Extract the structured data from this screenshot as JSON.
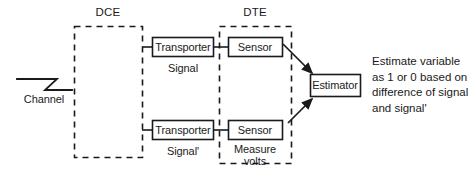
{
  "diagram": {
    "colors": {
      "stroke": "#1a1a1a",
      "background": "#ffffff",
      "text": "#1a1a1a"
    },
    "groups": [
      {
        "id": "dce",
        "label": "DCE"
      },
      {
        "id": "dte",
        "label": "DTE"
      }
    ],
    "source": {
      "label": "Channel",
      "symbol": "zigzag-line"
    },
    "blocks": [
      {
        "id": "transporter-top",
        "label": "Transporter"
      },
      {
        "id": "sensor-top",
        "label": "Sensor"
      },
      {
        "id": "transporter-bottom",
        "label": "Transporter"
      },
      {
        "id": "sensor-bottom",
        "label": "Sensor"
      },
      {
        "id": "estimator",
        "label": "Estimator"
      }
    ],
    "annotations": {
      "signal_top": "Signal",
      "signal_bottom": "Signal'",
      "measure_line1": "Measure",
      "measure_line2": "volts"
    },
    "note": {
      "line1": "Estimate variable",
      "line2": "as 1 or 0 based on",
      "line3": "difference of signal",
      "line4": "and signal'"
    }
  }
}
